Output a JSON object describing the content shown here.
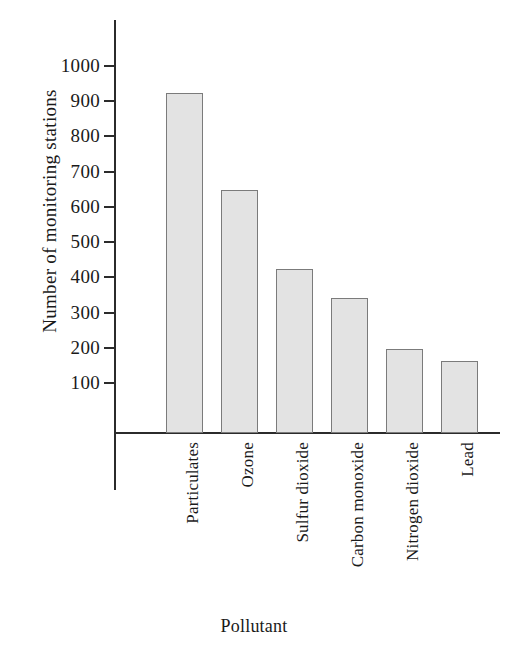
{
  "chart_data": {
    "type": "bar",
    "title": "",
    "xlabel": "Pollutant",
    "ylabel": "Number of monitoring stations",
    "categories": [
      "Particulates",
      "Ozone",
      "Sulfur dioxide",
      "Carbon monoxide",
      "Nitrogen dioxide",
      "Lead"
    ],
    "values": [
      920,
      645,
      420,
      338,
      193,
      160
    ],
    "ylim": [
      0,
      1000
    ],
    "ytick_labels": [
      "1000",
      "900",
      "800",
      "700",
      "600",
      "500",
      "400",
      "300",
      "200",
      "100"
    ],
    "ytick_values": [
      1000,
      900,
      800,
      700,
      600,
      500,
      400,
      300,
      200,
      100
    ],
    "grid": false,
    "legend": "none",
    "bar_fill_color": "#e3e3e3",
    "bar_border_color": "#7b7b7b",
    "axis_color": "#2b2b2b",
    "background_color": "#ffffff"
  }
}
